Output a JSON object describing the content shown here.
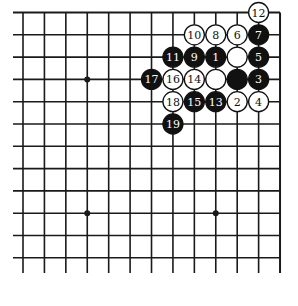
{
  "diagram": {
    "type": "go-board-partial",
    "grid": {
      "columns": 13,
      "rows": 12,
      "col_x0": 23,
      "col_spacing": 21.42,
      "row_y0": 12.5,
      "row_spacing": 22.3,
      "line_left_extend": 13,
      "line_bottom_extend": 273,
      "top_edge": true,
      "right_edge": true,
      "line_color": "#1a1a1a"
    },
    "star_points": [
      {
        "col": 3,
        "row": 3
      },
      {
        "col": 3,
        "row": 9
      },
      {
        "col": 9,
        "row": 9
      }
    ],
    "stones": [
      {
        "col": 9,
        "row": 2,
        "color": "black",
        "label": "1"
      },
      {
        "col": 10,
        "row": 4,
        "color": "white",
        "label": "2"
      },
      {
        "col": 11,
        "row": 3,
        "color": "black",
        "label": "3"
      },
      {
        "col": 11,
        "row": 4,
        "color": "white",
        "label": "4"
      },
      {
        "col": 11,
        "row": 2,
        "color": "black",
        "label": "5"
      },
      {
        "col": 10,
        "row": 1,
        "color": "white",
        "label": "6"
      },
      {
        "col": 11,
        "row": 1,
        "color": "black",
        "label": "7"
      },
      {
        "col": 9,
        "row": 1,
        "color": "white",
        "label": "8"
      },
      {
        "col": 8,
        "row": 2,
        "color": "black",
        "label": "9"
      },
      {
        "col": 8,
        "row": 1,
        "color": "white",
        "label": "10"
      },
      {
        "col": 7,
        "row": 2,
        "color": "black",
        "label": "11"
      },
      {
        "col": 11,
        "row": 0,
        "color": "white",
        "label": "12"
      },
      {
        "col": 9,
        "row": 4,
        "color": "black",
        "label": "13"
      },
      {
        "col": 8,
        "row": 3,
        "color": "white",
        "label": "14"
      },
      {
        "col": 8,
        "row": 4,
        "color": "black",
        "label": "15"
      },
      {
        "col": 7,
        "row": 3,
        "color": "white",
        "label": "16"
      },
      {
        "col": 6,
        "row": 3,
        "color": "black",
        "label": "17"
      },
      {
        "col": 7,
        "row": 4,
        "color": "white",
        "label": "18"
      },
      {
        "col": 7,
        "row": 5,
        "color": "black",
        "label": "19"
      },
      {
        "col": 10,
        "row": 2,
        "color": "white",
        "label": ""
      },
      {
        "col": 9,
        "row": 3,
        "color": "white",
        "label": ""
      },
      {
        "col": 10,
        "row": 3,
        "color": "black",
        "label": ""
      }
    ],
    "colors": {
      "black_stone": "#111111",
      "white_stone": "#ffffff",
      "stone_outline": "#111111",
      "black_label": "#ffffff",
      "white_label": "#111111",
      "background": "#ffffff"
    }
  }
}
